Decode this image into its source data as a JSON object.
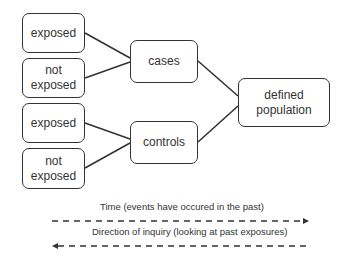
{
  "diagram": {
    "type": "case-control study design",
    "exposure_boxes": [
      {
        "label": "exposed"
      },
      {
        "label": "not exposed"
      },
      {
        "label": "exposed"
      },
      {
        "label": "not exposed"
      }
    ],
    "group_boxes": [
      {
        "label": "cases"
      },
      {
        "label": "controls"
      }
    ],
    "population_box": {
      "label": "defined population"
    },
    "time_arrow": {
      "label": "Time (events have occured in the past)",
      "direction": "right"
    },
    "inquiry_arrow": {
      "label": "Direction of inquiry (looking at past exposures)",
      "direction": "left"
    },
    "colors": {
      "stroke": "#333333",
      "background": "#ffffff"
    }
  }
}
